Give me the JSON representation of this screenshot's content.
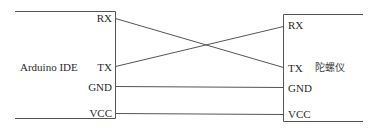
{
  "diagram": {
    "type": "wiring-diagram",
    "line_color": "#555555",
    "text_color": "#2a2a2a",
    "left_device": {
      "name": "Arduino IDE",
      "pins": [
        {
          "label": "RX",
          "y": 18
        },
        {
          "label": "TX",
          "y": 66
        },
        {
          "label": "GND",
          "y": 86
        },
        {
          "label": "VCC",
          "y": 113
        }
      ]
    },
    "right_device": {
      "name": "陀螺仪",
      "pins": [
        {
          "label": "RX",
          "y": 26
        },
        {
          "label": "TX",
          "y": 67
        },
        {
          "label": "GND",
          "y": 87
        },
        {
          "label": "VCC",
          "y": 114
        }
      ]
    },
    "connections": [
      {
        "from": "Arduino IDE.RX",
        "to": "陀螺仪.TX"
      },
      {
        "from": "Arduino IDE.TX",
        "to": "陀螺仪.RX"
      },
      {
        "from": "Arduino IDE.GND",
        "to": "陀螺仪.GND"
      },
      {
        "from": "Arduino IDE.VCC",
        "to": "陀螺仪.VCC"
      }
    ]
  }
}
